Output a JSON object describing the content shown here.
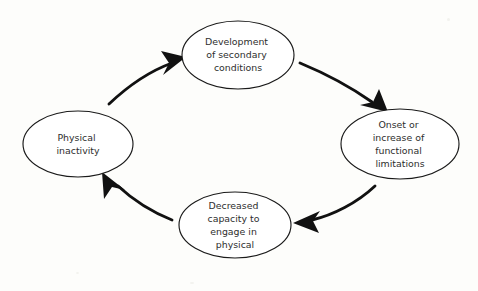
{
  "diagram": {
    "type": "cycle-diagram",
    "background_color": "#fdfdfb",
    "node_fill": "#ffffff",
    "node_stroke": "#1a1a1a",
    "text_color": "#2e2e2e",
    "arrow_color": "#111111",
    "nodes": [
      {
        "id": "physical-inactivity",
        "name": "Physical inactivity",
        "lines": [
          "Physical",
          "inactivity"
        ],
        "cx": 78,
        "cy": 144,
        "rx": 55,
        "ry": 33
      },
      {
        "id": "development-of-secondary-conditions",
        "name": "Development of secondary conditions",
        "lines": [
          "Development",
          "of secondary",
          "conditions"
        ],
        "cx": 238,
        "cy": 55,
        "rx": 56,
        "ry": 34
      },
      {
        "id": "onset-or-increase-of-functional-limitations",
        "name": "Onset or increase of functional limitations",
        "lines": [
          "Onset or",
          "increase of",
          "functional",
          "limitations"
        ],
        "cx": 400,
        "cy": 144,
        "rx": 59,
        "ry": 35
      },
      {
        "id": "decreased-capacity-to-engage-in-physical",
        "name": "Decreased capacity to engage in physical",
        "lines": [
          "Decreased",
          "capacity to",
          "engage in",
          "physical"
        ],
        "cx": 235,
        "cy": 225,
        "rx": 56,
        "ry": 33
      }
    ],
    "arrows": [
      {
        "id": "arrow-inactivity-to-development",
        "from": "physical-inactivity",
        "to": "development-of-secondary-conditions",
        "label": ""
      },
      {
        "id": "arrow-development-to-onset",
        "from": "development-of-secondary-conditions",
        "to": "onset-or-increase-of-functional-limitations",
        "label": ""
      },
      {
        "id": "arrow-onset-to-decreased-capacity",
        "from": "onset-or-increase-of-functional-limitations",
        "to": "decreased-capacity-to-engage-in-physical",
        "label": ""
      },
      {
        "id": "arrow-decreased-capacity-to-inactivity",
        "from": "decreased-capacity-to-engage-in-physical",
        "to": "physical-inactivity",
        "label": ""
      }
    ]
  }
}
